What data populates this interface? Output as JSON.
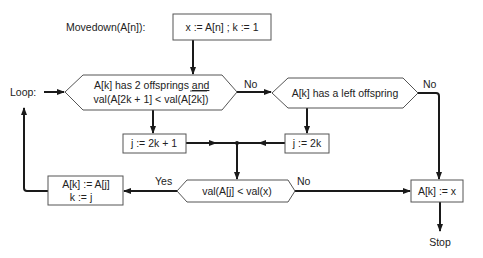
{
  "diagram": {
    "title": "Movedown(A[n]):",
    "loop_label": "Loop:",
    "nodes": {
      "init": "x := A[n] ; k := 1",
      "cond_two_offspring_line1": "A[k]  has 2 offsprings ",
      "cond_two_offspring_and": "and",
      "cond_two_offspring_line2": "val(A[2k + 1] < val(A[2k])",
      "cond_left_offspring": "A[k]  has a left offspring",
      "assign_j_2k1": "j := 2k + 1",
      "assign_j_2k": "j := 2k",
      "cond_compare": "val(A[j] < val(x)",
      "swap_line1": "A[k] := A[j]",
      "swap_line2": "k := j",
      "final_assign": "A[k]  := x",
      "stop": "Stop"
    },
    "edge_labels": {
      "cond1_no": "No",
      "cond2_no": "No",
      "compare_yes": "Yes",
      "compare_no": "No"
    },
    "colors": {
      "line": "#1a1a1a",
      "shape_border": "#555555",
      "background": "#ffffff"
    }
  }
}
